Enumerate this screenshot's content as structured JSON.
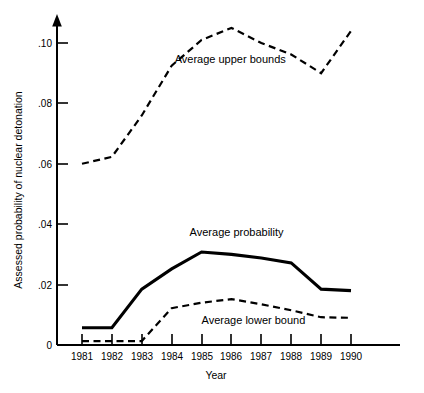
{
  "chart_data": {
    "type": "line",
    "title": "",
    "subtitle": "",
    "xlabel": "Year",
    "ylabel": "Assessed probability of nuclear detonation",
    "categories": [
      "1981",
      "1982",
      "1983",
      "1984",
      "1985",
      "1986",
      "1987",
      "1988",
      "1989",
      "1990"
    ],
    "x": [
      1981,
      1982,
      1983,
      1984,
      1985,
      1986,
      1987,
      1988,
      1989,
      1990
    ],
    "xlim": [
      1981,
      1990
    ],
    "ylim": [
      0,
      0.108
    ],
    "ytick_values": [
      0,
      0.02,
      0.04,
      0.06,
      0.08,
      0.1
    ],
    "ytick_labels": [
      "0",
      ".02",
      ".04",
      ".06",
      ".08",
      ".10"
    ],
    "grid": false,
    "legend": "inline-annotations",
    "series": [
      {
        "name": "Average upper bounds",
        "style": "dashed",
        "values": [
          0.06,
          0.0623,
          0.076,
          0.0925,
          0.101,
          0.105,
          0.1,
          0.0962,
          0.09,
          0.104
        ],
        "label_text": "Average upper bounds"
      },
      {
        "name": "Average probability",
        "style": "solid",
        "values": [
          0.0057,
          0.0057,
          0.0185,
          0.0252,
          0.0308,
          0.03,
          0.0288,
          0.0272,
          0.0185,
          0.018
        ],
        "label_text": "Average probability"
      },
      {
        "name": "Average lower bound",
        "style": "dashed",
        "values": [
          0.0013,
          0.0013,
          0.0013,
          0.0122,
          0.014,
          0.0152,
          0.0135,
          0.0115,
          0.0092,
          0.009
        ],
        "label_text": "Average lower bound"
      }
    ],
    "annotations": [
      {
        "text": "Average upper bounds",
        "x": 1984.1,
        "y": 0.0935
      },
      {
        "text": "Average probability",
        "x": 1984.6,
        "y": 0.0362
      },
      {
        "text": "Average lower bound",
        "x": 1985.0,
        "y": 0.0068
      }
    ]
  },
  "axes": {
    "y_title": "Assessed probability of nuclear detonation",
    "x_title": "Year",
    "y_ticks": [
      {
        "label": ".10",
        "value": 0.1
      },
      {
        "label": ".08",
        "value": 0.08
      },
      {
        "label": ".06",
        "value": 0.06
      },
      {
        "label": ".04",
        "value": 0.04
      },
      {
        "label": ".02",
        "value": 0.02
      },
      {
        "label": "0",
        "value": 0
      }
    ],
    "x_ticks": [
      {
        "label": "1981"
      },
      {
        "label": "1982"
      },
      {
        "label": "1983"
      },
      {
        "label": "1984"
      },
      {
        "label": "1985"
      },
      {
        "label": "1986"
      },
      {
        "label": "1987"
      },
      {
        "label": "1988"
      },
      {
        "label": "1989"
      },
      {
        "label": "1990"
      }
    ]
  },
  "colors": {
    "line": "#000000",
    "axis": "#000000",
    "background": "#ffffff"
  }
}
